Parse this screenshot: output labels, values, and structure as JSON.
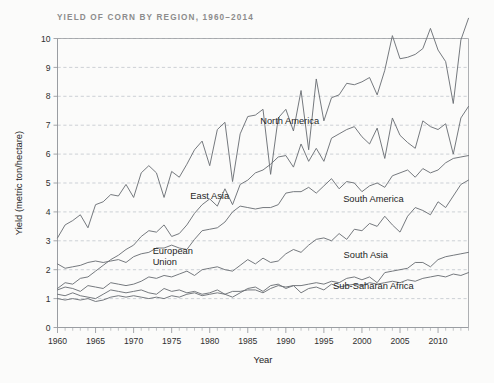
{
  "chart_data": {
    "type": "line",
    "title": "YIELD OF CORN BY REGION, 1960–2014",
    "xlabel": "Year",
    "ylabel": "Yield (metric ton/hectare)",
    "xlim": [
      1960,
      2014
    ],
    "ylim": [
      0,
      10
    ],
    "grid": true,
    "legend_position": "inline-annotations",
    "xticks": [
      1960,
      1965,
      1970,
      1975,
      1980,
      1985,
      1990,
      1995,
      2000,
      2005,
      2010
    ],
    "xticklabels": [
      "1960",
      "1965",
      "1970",
      "1975",
      "1980",
      "1985",
      "1990",
      "1995",
      "2000",
      "2005",
      "2010"
    ],
    "yticks": [
      0,
      1,
      2,
      3,
      4,
      5,
      6,
      7,
      8,
      9,
      10
    ],
    "yticklabels": [
      "0",
      "1",
      "2",
      "3",
      "4",
      "5",
      "6",
      "7",
      "8",
      "9",
      "10"
    ],
    "minor_xtick_interval": 1,
    "x": [
      1960,
      1961,
      1962,
      1963,
      1964,
      1965,
      1966,
      1967,
      1968,
      1969,
      1970,
      1971,
      1972,
      1973,
      1974,
      1975,
      1976,
      1977,
      1978,
      1979,
      1980,
      1981,
      1982,
      1983,
      1984,
      1985,
      1986,
      1987,
      1988,
      1989,
      1990,
      1991,
      1992,
      1993,
      1994,
      1995,
      1996,
      1997,
      1998,
      1999,
      2000,
      2001,
      2002,
      2003,
      2004,
      2005,
      2006,
      2007,
      2008,
      2009,
      2010,
      2011,
      2012,
      2013,
      2014
    ],
    "series": [
      {
        "name": "North America",
        "label_x": 1990.5,
        "label_y": 7.05,
        "color": "#6e7277",
        "values": [
          3.1,
          3.55,
          3.7,
          3.9,
          3.45,
          4.25,
          4.35,
          4.6,
          4.55,
          4.95,
          4.5,
          5.35,
          5.6,
          5.35,
          4.5,
          5.4,
          5.2,
          5.65,
          6.15,
          6.45,
          5.6,
          6.85,
          7.1,
          5.05,
          6.7,
          7.3,
          7.35,
          7.55,
          5.3,
          7.25,
          7.55,
          6.8,
          8.2,
          6.15,
          8.6,
          7.15,
          7.95,
          8.05,
          8.45,
          8.4,
          8.5,
          8.65,
          8.05,
          8.9,
          10.1,
          9.3,
          9.35,
          9.45,
          9.65,
          10.35,
          9.6,
          9.2,
          7.75,
          9.95,
          10.7
        ]
      },
      {
        "name": "European Union",
        "label_x": 1972.5,
        "label_y": 2.55,
        "color": "#6e7277",
        "values": [
          1.35,
          1.55,
          1.5,
          1.7,
          1.75,
          1.95,
          2.15,
          2.35,
          2.5,
          2.7,
          2.85,
          3.15,
          3.35,
          3.3,
          3.55,
          3.15,
          3.25,
          3.55,
          3.95,
          4.25,
          4.45,
          4.2,
          4.8,
          4.25,
          4.95,
          5.1,
          5.35,
          5.45,
          5.65,
          5.9,
          5.95,
          5.55,
          6.35,
          5.75,
          6.2,
          5.75,
          6.55,
          6.7,
          6.85,
          6.95,
          6.6,
          6.35,
          6.9,
          5.85,
          7.25,
          6.65,
          6.4,
          6.2,
          7.15,
          6.95,
          6.85,
          7.05,
          6.0,
          7.25,
          7.65
        ]
      },
      {
        "name": "East Asia",
        "label_x": 1980.0,
        "label_y": 4.45,
        "color": "#6e7277",
        "values": [
          2.2,
          2.05,
          2.1,
          2.15,
          2.25,
          2.3,
          2.25,
          2.3,
          2.35,
          2.25,
          2.45,
          2.55,
          2.6,
          2.75,
          2.75,
          2.85,
          2.75,
          2.7,
          3.05,
          3.35,
          3.4,
          3.45,
          3.65,
          4.0,
          4.2,
          4.15,
          4.1,
          4.15,
          4.15,
          4.25,
          4.65,
          4.7,
          4.7,
          4.85,
          4.65,
          4.9,
          5.15,
          4.8,
          5.05,
          5.0,
          4.7,
          4.9,
          5.0,
          4.85,
          5.25,
          5.35,
          5.45,
          5.2,
          5.5,
          5.35,
          5.45,
          5.7,
          5.85,
          5.9,
          5.95
        ]
      },
      {
        "name": "South America",
        "label_x": 2001.5,
        "label_y": 4.35,
        "color": "#6e7277",
        "values": [
          1.3,
          1.4,
          1.35,
          1.25,
          1.45,
          1.4,
          1.35,
          1.55,
          1.5,
          1.45,
          1.5,
          1.6,
          1.75,
          1.7,
          1.8,
          1.75,
          1.85,
          1.95,
          1.8,
          2.0,
          2.05,
          2.1,
          2.0,
          1.95,
          2.15,
          2.35,
          2.2,
          2.4,
          2.25,
          2.3,
          2.55,
          2.7,
          2.6,
          2.85,
          3.05,
          3.1,
          3.0,
          3.25,
          3.05,
          3.4,
          3.35,
          3.6,
          3.5,
          3.85,
          3.55,
          3.3,
          3.85,
          4.15,
          4.05,
          3.9,
          4.35,
          4.15,
          4.55,
          4.95,
          5.1
        ]
      },
      {
        "name": "South Asia",
        "label_x": 2000.5,
        "label_y": 2.4,
        "color": "#6e7277",
        "values": [
          1.0,
          0.95,
          1.0,
          0.95,
          1.0,
          0.9,
          0.95,
          1.05,
          1.1,
          1.05,
          1.1,
          1.05,
          1.0,
          1.05,
          1.0,
          1.1,
          1.05,
          1.15,
          1.2,
          1.1,
          1.15,
          1.2,
          1.15,
          1.25,
          1.25,
          1.3,
          1.3,
          1.2,
          1.35,
          1.45,
          1.4,
          1.45,
          1.45,
          1.5,
          1.55,
          1.5,
          1.6,
          1.55,
          1.7,
          1.75,
          1.65,
          1.75,
          1.55,
          1.9,
          1.95,
          2.0,
          2.05,
          2.25,
          2.25,
          2.1,
          2.35,
          2.45,
          2.5,
          2.55,
          2.6
        ]
      },
      {
        "name": "Sub-Saharan Africa",
        "label_x": 2001.5,
        "label_y": 1.32,
        "color": "#6e7277",
        "values": [
          1.15,
          1.1,
          1.2,
          1.1,
          1.05,
          1.0,
          1.15,
          1.3,
          1.25,
          1.2,
          1.25,
          1.3,
          1.2,
          1.15,
          1.35,
          1.25,
          1.3,
          1.2,
          1.25,
          1.15,
          1.2,
          1.3,
          1.15,
          1.05,
          1.2,
          1.35,
          1.4,
          1.25,
          1.45,
          1.5,
          1.35,
          1.45,
          1.2,
          1.35,
          1.4,
          1.3,
          1.5,
          1.4,
          1.45,
          1.5,
          1.45,
          1.55,
          1.5,
          1.55,
          1.6,
          1.55,
          1.65,
          1.6,
          1.7,
          1.75,
          1.8,
          1.75,
          1.85,
          1.8,
          1.9
        ]
      }
    ]
  }
}
